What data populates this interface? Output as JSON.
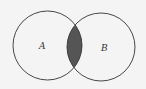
{
  "diagram": {
    "type": "venn",
    "sets": [
      {
        "label": "A",
        "cx": 47.5,
        "cy": 45.5,
        "r": 34.5
      },
      {
        "label": "B",
        "cx": 101,
        "cy": 47,
        "r": 34
      }
    ],
    "intersection_fill": "#555555",
    "stroke": "#333333",
    "background": "#f4f4f4"
  }
}
